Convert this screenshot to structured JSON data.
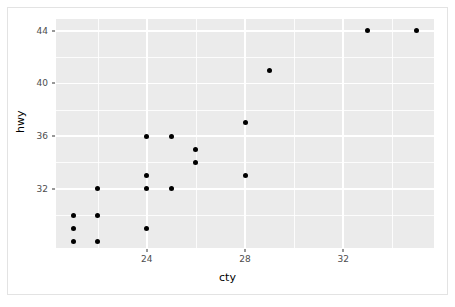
{
  "chart_data": {
    "type": "scatter",
    "title": "",
    "xlabel": "cty",
    "ylabel": "hwy",
    "xlim": [
      20.3,
      35.7
    ],
    "ylim": [
      27.5,
      44.9
    ],
    "grid": true,
    "legend": null,
    "x_ticks": [
      24,
      28,
      32
    ],
    "y_ticks": [
      32,
      36,
      40,
      44
    ],
    "x_tick_labels": [
      "24",
      "28",
      "32"
    ],
    "y_tick_labels": [
      "32",
      "36",
      "40",
      "44"
    ],
    "x_minor_ticks": [
      22,
      26,
      30,
      34
    ],
    "y_minor_ticks": [
      30,
      34,
      38,
      42
    ],
    "point_color": "#000000",
    "panel_color": "#ebebeb",
    "grid_color": "#ffffff",
    "points": [
      {
        "x": 21,
        "y": 30
      },
      {
        "x": 21,
        "y": 29
      },
      {
        "x": 21,
        "y": 28
      },
      {
        "x": 22,
        "y": 32
      },
      {
        "x": 22,
        "y": 30
      },
      {
        "x": 22,
        "y": 28
      },
      {
        "x": 24,
        "y": 36
      },
      {
        "x": 24,
        "y": 33
      },
      {
        "x": 24,
        "y": 32
      },
      {
        "x": 24,
        "y": 29
      },
      {
        "x": 25,
        "y": 36
      },
      {
        "x": 25,
        "y": 32
      },
      {
        "x": 26,
        "y": 35
      },
      {
        "x": 26,
        "y": 34
      },
      {
        "x": 28,
        "y": 37
      },
      {
        "x": 28,
        "y": 33
      },
      {
        "x": 29,
        "y": 41
      },
      {
        "x": 33,
        "y": 44
      },
      {
        "x": 35,
        "y": 44
      }
    ]
  },
  "axes": {
    "x_title": "cty",
    "y_title": "hwy"
  }
}
